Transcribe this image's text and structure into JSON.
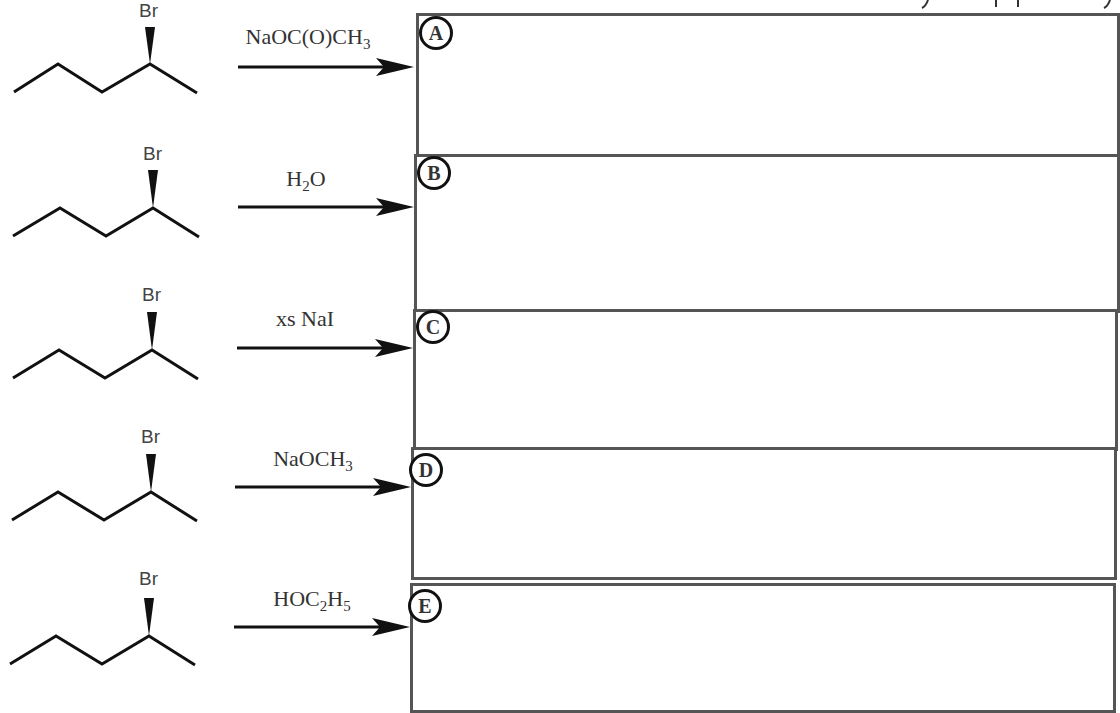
{
  "reactions": [
    {
      "substrate": "(S)-2-bromopentane",
      "br_label": "Br",
      "reagent_main": "NaOC(O)CH",
      "reagent_sub": "3",
      "reagent_tail": "",
      "box_label": "A"
    },
    {
      "substrate": "(S)-2-bromopentane",
      "br_label": "Br",
      "reagent_main": "H",
      "reagent_sub": "2",
      "reagent_tail": "O",
      "box_label": "B"
    },
    {
      "substrate": "(S)-2-bromopentane",
      "br_label": "Br",
      "reagent_main": "xs NaI",
      "reagent_sub": "",
      "reagent_tail": "",
      "box_label": "C"
    },
    {
      "substrate": "(S)-2-bromopentane",
      "br_label": "Br",
      "reagent_main": "NaOCH",
      "reagent_sub": "3",
      "reagent_tail": "",
      "box_label": "D"
    },
    {
      "substrate": "(S)-2-bromopentane",
      "br_label": "Br",
      "reagent_main": "HOC",
      "reagent_sub": "2",
      "reagent_tail": "H",
      "reagent_sub2": "5",
      "box_label": "E"
    }
  ],
  "colors": {
    "line": "#111111",
    "box_border": "#555555",
    "text": "#333333"
  }
}
